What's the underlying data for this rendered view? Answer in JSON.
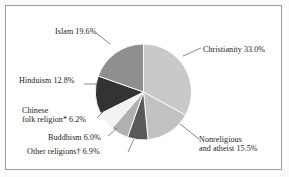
{
  "chart_data": {
    "type": "pie",
    "title": "",
    "subtitle": "",
    "xlabel": "",
    "ylabel": "",
    "legend_position": "callout-labels",
    "grid": false,
    "start_angle_deg": 0,
    "direction": "clockwise",
    "categories": [
      "Christianity",
      "Nonreligious and atheist",
      "Other religions†",
      "Buddhism",
      "Chinese folk religion*",
      "Hinduism",
      "Islam"
    ],
    "values": [
      33.0,
      15.5,
      6.9,
      6.0,
      6.2,
      12.8,
      19.6
    ],
    "unit": "%",
    "slices": [
      {
        "name": "Christianity",
        "value": 33.0,
        "label": "Christianity 33.0%",
        "color": "#c9c9c9"
      },
      {
        "name": "Nonreligious and atheist",
        "value": 15.5,
        "label_line1": "Nonreligious",
        "label_line2": "and atheist 15.5%",
        "color": "#c2c2c2"
      },
      {
        "name": "Other religions†",
        "value": 6.9,
        "label": "Other religions† 6.9%",
        "color": "#595959"
      },
      {
        "name": "Buddhism",
        "value": 6.0,
        "label": "Buddhism 6.0%",
        "color": "#b0b0b0"
      },
      {
        "name": "Chinese folk religion*",
        "value": 6.2,
        "label_line1": "Chinese",
        "label_line2": "folk religion* 6.2%",
        "color": "#f2f2f2"
      },
      {
        "name": "Hinduism",
        "value": 12.8,
        "label": "Hinduism 12.8%",
        "color": "#333333"
      },
      {
        "name": "Islam",
        "value": 19.6,
        "label": "Islam 19.6%",
        "color": "#8f8f8f"
      }
    ]
  },
  "labels": {
    "christianity": "Christianity 33.0%",
    "nonreligious_line1": "Nonreligious",
    "nonreligious_line2": "and atheist 15.5%",
    "islam": "Islam 19.6%",
    "hinduism": "Hinduism 12.8%",
    "chinese_line1": "Chinese",
    "chinese_line2": "folk religion* 6.2%",
    "buddhism": "Buddhism 6.0%",
    "other": "Other religions† 6.9%"
  },
  "style": {
    "frame_color": "#9a9a9a",
    "background": "#ffffff",
    "slice_outline": "#ffffff",
    "text_color": "#1a1a1a",
    "leader_color": "#555555"
  }
}
